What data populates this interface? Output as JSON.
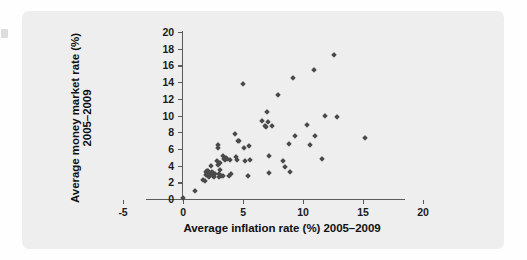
{
  "figure": {
    "panel_background": "#eeeeee",
    "marker_color": "#4a4a4a",
    "axis_color": "#5b5b5b"
  },
  "chart_data": {
    "type": "scatter",
    "title": "",
    "xlabel": "Average inflation rate (%) 2005–2009",
    "ylabel": "Average money market rate (%) 2005–2009",
    "xlim": [
      -5,
      20
    ],
    "ylim": [
      0,
      20
    ],
    "xticks": [
      -5,
      0,
      5,
      10,
      15,
      20
    ],
    "yticks": [
      0,
      2,
      4,
      6,
      8,
      10,
      12,
      14,
      16,
      18,
      20
    ],
    "xtick_labels": [
      "-5",
      "0",
      "5",
      "10",
      "15",
      "20"
    ],
    "ytick_labels": [
      "0",
      "2",
      "4",
      "6",
      "8",
      "10",
      "12",
      "14",
      "16",
      "18",
      "20"
    ],
    "grid": false,
    "legend": null,
    "series": [
      {
        "name": "Countries",
        "marker": "diamond",
        "color": "#4a4a4a",
        "points": [
          [
            0.0,
            0.1
          ],
          [
            1.0,
            1.0
          ],
          [
            1.7,
            2.3
          ],
          [
            1.8,
            2.1
          ],
          [
            1.9,
            3.2
          ],
          [
            1.9,
            2.9
          ],
          [
            2.0,
            3.3
          ],
          [
            2.0,
            3.0
          ],
          [
            2.1,
            3.4
          ],
          [
            2.1,
            2.8
          ],
          [
            2.2,
            3.1
          ],
          [
            2.2,
            2.6
          ],
          [
            2.3,
            3.9
          ],
          [
            2.3,
            3.0
          ],
          [
            2.4,
            3.2
          ],
          [
            2.5,
            2.7
          ],
          [
            2.5,
            3.1
          ],
          [
            2.6,
            2.6
          ],
          [
            2.7,
            3.0
          ],
          [
            2.8,
            4.6
          ],
          [
            2.9,
            6.1
          ],
          [
            2.9,
            6.5
          ],
          [
            2.9,
            4.1
          ],
          [
            3.0,
            3.0
          ],
          [
            3.0,
            2.6
          ],
          [
            3.1,
            4.3
          ],
          [
            3.1,
            3.5
          ],
          [
            3.2,
            2.8
          ],
          [
            3.3,
            5.1
          ],
          [
            3.3,
            2.7
          ],
          [
            3.4,
            4.8
          ],
          [
            3.5,
            4.7
          ],
          [
            3.6,
            4.9
          ],
          [
            3.7,
            4.8
          ],
          [
            3.8,
            2.8
          ],
          [
            3.9,
            4.7
          ],
          [
            4.0,
            3.0
          ],
          [
            4.3,
            7.8
          ],
          [
            4.4,
            5.0
          ],
          [
            4.5,
            4.7
          ],
          [
            4.6,
            7.0
          ],
          [
            4.7,
            6.9
          ],
          [
            5.0,
            13.8
          ],
          [
            5.1,
            6.1
          ],
          [
            5.2,
            4.6
          ],
          [
            5.4,
            2.8
          ],
          [
            5.5,
            6.4
          ],
          [
            5.6,
            4.7
          ],
          [
            6.6,
            9.4
          ],
          [
            6.8,
            8.7
          ],
          [
            6.9,
            8.6
          ],
          [
            7.0,
            10.4
          ],
          [
            7.1,
            9.2
          ],
          [
            7.2,
            5.1
          ],
          [
            7.2,
            3.1
          ],
          [
            7.4,
            8.8
          ],
          [
            7.9,
            12.5
          ],
          [
            8.3,
            4.6
          ],
          [
            8.5,
            3.8
          ],
          [
            8.8,
            6.6
          ],
          [
            8.9,
            3.2
          ],
          [
            9.2,
            14.5
          ],
          [
            9.3,
            7.6
          ],
          [
            10.3,
            8.9
          ],
          [
            10.6,
            6.5
          ],
          [
            10.9,
            15.4
          ],
          [
            11.0,
            7.5
          ],
          [
            11.6,
            4.8
          ],
          [
            11.8,
            9.9
          ],
          [
            12.6,
            17.3
          ],
          [
            12.8,
            9.8
          ],
          [
            15.2,
            7.3
          ]
        ]
      }
    ]
  }
}
